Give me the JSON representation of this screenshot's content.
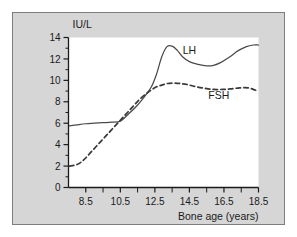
{
  "figure": {
    "background_color": "#d6d6d6",
    "plot_background_color": "#ffffff",
    "frame_border_color": "#7d7d7d",
    "axis_color": "#1a1a1a"
  },
  "chart_data": {
    "type": "line",
    "title": "",
    "subtitle": "",
    "xlabel": "Bone age (years)",
    "ylabel": "IU/L",
    "ylabel_position": "top-left",
    "xlim": [
      7.5,
      18.5
    ],
    "ylim": [
      0,
      14
    ],
    "grid": false,
    "legend": "inline-annotations",
    "x_ticks_major": [
      8.5,
      10.5,
      12.5,
      14.5,
      16.5,
      18.5
    ],
    "x_tick_labels": [
      "8.5",
      "10.5",
      "12.5",
      "14.5",
      "16.5",
      "18.5"
    ],
    "x_ticks_minor": [
      9.5,
      11.5,
      13.5,
      15.5,
      17.5
    ],
    "y_ticks_major": [
      0,
      2,
      4,
      6,
      8,
      10,
      12,
      14
    ],
    "y_tick_labels": [
      "0",
      "2",
      "4",
      "6",
      "8",
      "10",
      "12",
      "14"
    ],
    "y_ticks_minor": [
      1,
      3,
      5,
      7,
      9,
      11,
      13
    ],
    "series": [
      {
        "name": "LH",
        "style": "solid",
        "color": "#4a4a4a",
        "annotation": "LH",
        "annotation_x": 14.5,
        "annotation_y": 12.45,
        "x": [
          7.55,
          8.0,
          8.5,
          9.0,
          9.5,
          10.0,
          10.5,
          11.0,
          11.5,
          12.0,
          12.3,
          12.6,
          12.9,
          13.2,
          13.5,
          13.8,
          14.1,
          14.5,
          15.0,
          15.5,
          15.9,
          16.3,
          16.8,
          17.3,
          17.8,
          18.2,
          18.5
        ],
        "y": [
          5.75,
          5.85,
          5.95,
          6.0,
          6.05,
          6.1,
          6.2,
          6.9,
          7.7,
          8.7,
          9.4,
          10.6,
          12.2,
          13.15,
          13.2,
          12.8,
          12.2,
          11.75,
          11.5,
          11.35,
          11.4,
          11.65,
          12.15,
          12.75,
          13.15,
          13.3,
          13.3
        ]
      },
      {
        "name": "FSH",
        "style": "dashed",
        "color": "#3a3a3a",
        "annotation": "FSH",
        "annotation_x": 16.2,
        "annotation_y": 8.25,
        "x": [
          7.55,
          8.0,
          8.4,
          8.8,
          9.2,
          9.6,
          10.0,
          10.4,
          10.8,
          11.2,
          11.6,
          12.0,
          12.3,
          12.6,
          12.9,
          13.2,
          13.6,
          14.0,
          14.4,
          14.9,
          15.4,
          15.9,
          16.4,
          16.9,
          17.4,
          17.9,
          18.3,
          18.5
        ],
        "y": [
          2.0,
          2.15,
          2.6,
          3.3,
          4.0,
          4.7,
          5.4,
          6.1,
          6.8,
          7.5,
          8.2,
          8.75,
          9.1,
          9.4,
          9.55,
          9.7,
          9.75,
          9.7,
          9.6,
          9.4,
          9.25,
          9.15,
          9.15,
          9.2,
          9.3,
          9.3,
          9.1,
          9.0
        ]
      }
    ]
  }
}
